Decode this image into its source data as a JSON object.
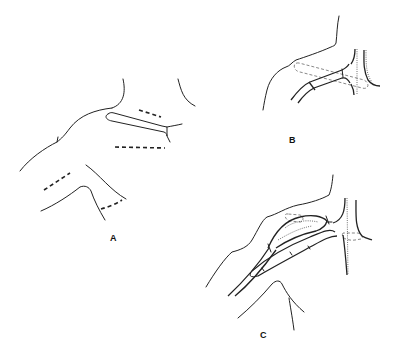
{
  "figure": {
    "panels": [
      {
        "id": "A",
        "label": "A",
        "description": "Shoulder/neck outline with dashed incision lines and elongated graft outline"
      },
      {
        "id": "B",
        "label": "B",
        "description": "Vessel with graft segment and dashed outline of exposure"
      },
      {
        "id": "C",
        "label": "C",
        "description": "Completed vascular graft anastomosis in shoulder region"
      }
    ]
  }
}
